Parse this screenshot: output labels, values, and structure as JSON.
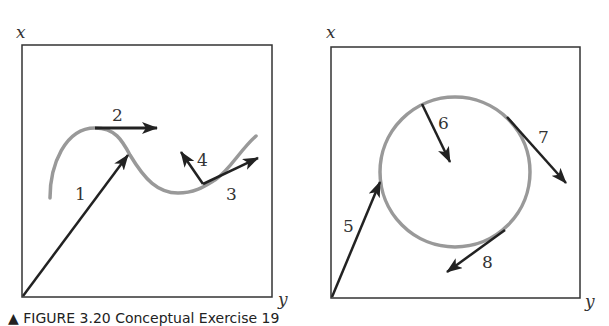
{
  "panels": [
    {
      "id": "left",
      "axes": {
        "vertical": "x",
        "horizontal": "y"
      },
      "curve": "wavy path",
      "vectors": [
        {
          "label": "1",
          "description": "position vector from origin to curve"
        },
        {
          "label": "2",
          "description": "tangent at local maximum, pointing right"
        },
        {
          "label": "3",
          "description": "tangent along curve, pointing up-right"
        },
        {
          "label": "4",
          "description": "vector pointing up-left from curve point"
        }
      ]
    },
    {
      "id": "right",
      "axes": {
        "vertical": "x",
        "horizontal": "y"
      },
      "curve": "circle",
      "vectors": [
        {
          "label": "5",
          "description": "position vector from origin to circle"
        },
        {
          "label": "6",
          "description": "vector pointing toward center"
        },
        {
          "label": "7",
          "description": "tangent vector pointing down-right"
        },
        {
          "label": "8",
          "description": "tangent vector pointing down-left"
        }
      ]
    }
  ],
  "colors": {
    "frame": "#333333",
    "curve": "#999999",
    "vector": "#222222"
  },
  "caption": "▲ FIGURE 3.20 Conceptual Exercise 19"
}
